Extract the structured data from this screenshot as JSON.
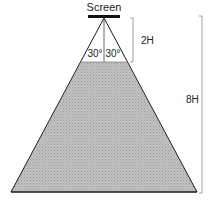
{
  "diagram": {
    "title": "Screen",
    "angles": {
      "left": "30°",
      "right": "30°"
    },
    "dimensions": {
      "near": "2H",
      "far": "8H"
    },
    "colors": {
      "line": "#1a1a1a",
      "fill": "#b3b3b3",
      "bracket": "#888888",
      "background": "#ffffff"
    }
  }
}
